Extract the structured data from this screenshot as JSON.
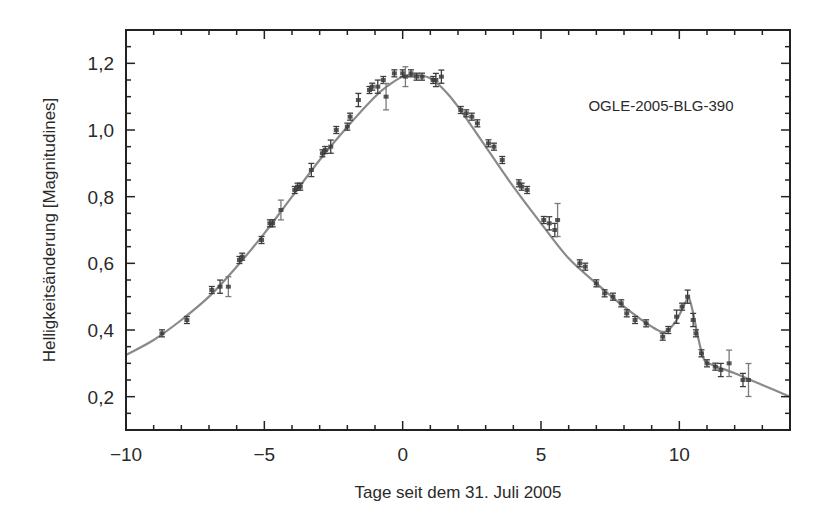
{
  "chart_data": {
    "type": "scatter",
    "title": "",
    "annotation": "OGLE-2005-BLG-390",
    "xlabel": "Tage seit dem 31. Juli 2005",
    "ylabel": "Helligkeitsänderung [Magnitudines]",
    "xlim": [
      -10,
      14
    ],
    "ylim": [
      0.1,
      1.3
    ],
    "xticks": [
      -10,
      -5,
      0,
      5,
      10
    ],
    "xtick_labels": [
      "−10",
      "−5",
      "0",
      "5",
      "10"
    ],
    "yticks": [
      0.2,
      0.4,
      0.6,
      0.8,
      1.0,
      1.2
    ],
    "ytick_labels": [
      "0,2",
      "0,4",
      "0,6",
      "0,8",
      "1,0",
      "1,2"
    ],
    "grid": false,
    "legend": null,
    "series": [
      {
        "name": "model-fit",
        "kind": "line",
        "color": "#8a8a8a",
        "x": [
          -10,
          -9,
          -8,
          -7,
          -6,
          -5,
          -4,
          -3,
          -2,
          -1,
          -0.5,
          0,
          0.5,
          1,
          1.5,
          2,
          3,
          4,
          5,
          6,
          7,
          8,
          9,
          9.5,
          9.9,
          10.2,
          10.35,
          10.5,
          10.7,
          10.9,
          11.2,
          12,
          13,
          14
        ],
        "y": [
          0.325,
          0.37,
          0.43,
          0.5,
          0.59,
          0.69,
          0.8,
          0.91,
          1.01,
          1.1,
          1.135,
          1.16,
          1.165,
          1.155,
          1.12,
          1.07,
          0.95,
          0.83,
          0.72,
          0.615,
          0.54,
          0.47,
          0.41,
          0.395,
          0.43,
          0.48,
          0.495,
          0.45,
          0.37,
          0.31,
          0.295,
          0.27,
          0.235,
          0.2
        ]
      },
      {
        "name": "observations",
        "kind": "errorbar",
        "color": "#3c3c3c",
        "x": [
          -8.7,
          -7.8,
          -6.9,
          -6.6,
          -6.3,
          -5.9,
          -5.8,
          -5.1,
          -4.8,
          -4.7,
          -4.4,
          -3.9,
          -3.8,
          -3.7,
          -3.3,
          -2.9,
          -2.8,
          -2.6,
          -2.4,
          -2.0,
          -1.9,
          -1.6,
          -1.2,
          -1.1,
          -0.9,
          -0.7,
          -0.6,
          -0.3,
          0.0,
          0.1,
          0.3,
          0.5,
          0.7,
          1.1,
          1.2,
          1.4,
          2.1,
          2.3,
          2.5,
          2.7,
          3.1,
          3.3,
          3.6,
          4.2,
          4.3,
          4.5,
          5.1,
          5.3,
          5.5,
          5.6,
          6.4,
          6.6,
          7.0,
          7.3,
          7.6,
          7.9,
          8.1,
          8.4,
          8.8,
          9.4,
          9.6,
          9.9,
          10.1,
          10.3,
          10.5,
          10.6,
          10.8,
          11.0,
          11.3,
          11.5,
          11.8,
          12.3,
          12.5
        ],
        "y": [
          0.39,
          0.43,
          0.52,
          0.53,
          0.53,
          0.61,
          0.62,
          0.67,
          0.72,
          0.72,
          0.76,
          0.82,
          0.83,
          0.83,
          0.88,
          0.93,
          0.94,
          0.95,
          1.0,
          1.01,
          1.04,
          1.09,
          1.12,
          1.13,
          1.13,
          1.15,
          1.1,
          1.17,
          1.17,
          1.16,
          1.17,
          1.16,
          1.16,
          1.15,
          1.15,
          1.16,
          1.06,
          1.05,
          1.04,
          1.02,
          0.96,
          0.95,
          0.91,
          0.84,
          0.83,
          0.82,
          0.73,
          0.72,
          0.7,
          0.73,
          0.6,
          0.59,
          0.54,
          0.51,
          0.5,
          0.48,
          0.45,
          0.43,
          0.42,
          0.38,
          0.4,
          0.44,
          0.47,
          0.5,
          0.43,
          0.39,
          0.33,
          0.3,
          0.29,
          0.28,
          0.3,
          0.25,
          0.25
        ],
        "err": [
          0.01,
          0.01,
          0.01,
          0.02,
          0.03,
          0.01,
          0.01,
          0.01,
          0.01,
          0.01,
          0.03,
          0.01,
          0.01,
          0.01,
          0.02,
          0.01,
          0.01,
          0.02,
          0.01,
          0.01,
          0.01,
          0.02,
          0.01,
          0.01,
          0.02,
          0.01,
          0.04,
          0.01,
          0.01,
          0.03,
          0.01,
          0.01,
          0.01,
          0.01,
          0.02,
          0.02,
          0.01,
          0.01,
          0.01,
          0.01,
          0.01,
          0.01,
          0.01,
          0.01,
          0.01,
          0.01,
          0.01,
          0.02,
          0.02,
          0.05,
          0.01,
          0.01,
          0.01,
          0.01,
          0.01,
          0.01,
          0.01,
          0.01,
          0.01,
          0.01,
          0.01,
          0.02,
          0.01,
          0.02,
          0.02,
          0.01,
          0.01,
          0.01,
          0.01,
          0.02,
          0.04,
          0.02,
          0.05
        ]
      }
    ]
  },
  "frame": {
    "left": 126,
    "top": 30,
    "right": 790,
    "bottom": 430,
    "line_color": "#222222",
    "curve_color": "#8a8a8a",
    "point_color": "#3c3c3c"
  }
}
